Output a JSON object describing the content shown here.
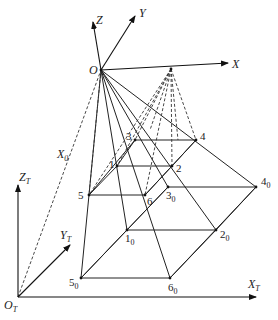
{
  "diagram": {
    "camera_frame": {
      "origin": {
        "label": "O",
        "x": 101,
        "y": 70
      },
      "axes": [
        {
          "label": "Z",
          "tip": [
            93,
            22
          ]
        },
        {
          "label": "Y",
          "tip": [
            135,
            16
          ]
        },
        {
          "label": "X",
          "tip": [
            228,
            63
          ]
        }
      ]
    },
    "target_frame": {
      "origin": {
        "label": "O",
        "sub": "T",
        "x": 18,
        "y": 297
      },
      "axes": [
        {
          "label": "Z",
          "sub": "T",
          "tip": [
            18,
            185
          ]
        },
        {
          "label": "Y",
          "sub": "T",
          "tip": [
            70,
            245
          ]
        },
        {
          "label": "X",
          "sub": "T",
          "tip": [
            256,
            297
          ]
        }
      ]
    },
    "distance_label": {
      "label": "X",
      "sub": "0"
    },
    "secondary_source": {
      "x": 171,
      "y": 69
    },
    "image_points": [
      {
        "id": "1",
        "x": 117,
        "y": 166
      },
      {
        "id": "2",
        "x": 172,
        "y": 166
      },
      {
        "id": "3",
        "x": 135,
        "y": 140
      },
      {
        "id": "4",
        "x": 196,
        "y": 140
      },
      {
        "id": "5",
        "x": 89,
        "y": 195
      },
      {
        "id": "6",
        "x": 145,
        "y": 195
      }
    ],
    "object_points": [
      {
        "id": "1",
        "sub": "0",
        "x": 127,
        "y": 230
      },
      {
        "id": "2",
        "sub": "0",
        "x": 216,
        "y": 230
      },
      {
        "id": "3",
        "sub": "0",
        "x": 168,
        "y": 187
      },
      {
        "id": "4",
        "sub": "0",
        "x": 256,
        "y": 187
      },
      {
        "id": "5",
        "sub": "0",
        "x": 81,
        "y": 278
      },
      {
        "id": "6",
        "sub": "0",
        "x": 170,
        "y": 278
      }
    ]
  }
}
